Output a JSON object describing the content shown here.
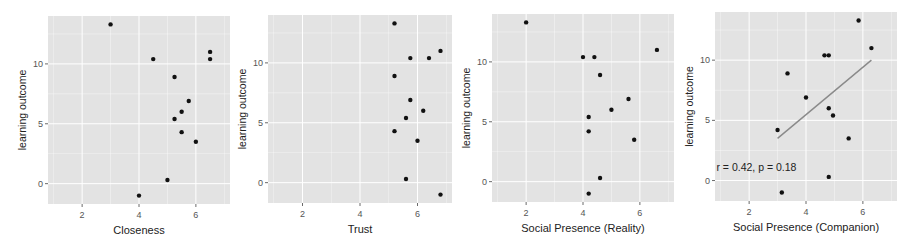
{
  "figure": {
    "background": "#ffffff",
    "panel_background": "#e3e3e3",
    "grid_color": "#ffffff",
    "point_color": "#111111",
    "line_color": "#8a8a8a",
    "axis_text_color": "#555555",
    "label_color": "#222222"
  },
  "chart_data": [
    {
      "type": "scatter",
      "title": "",
      "xlabel": "Closeness",
      "ylabel": "learning outcome",
      "xlim": [
        0.8,
        7.2
      ],
      "ylim": [
        -1.7,
        14.0
      ],
      "xticks": [
        2,
        4,
        6
      ],
      "yticks": [
        0,
        5,
        10
      ],
      "grid": true,
      "points": [
        {
          "x": 3.0,
          "y": 13.3
        },
        {
          "x": 4.5,
          "y": 10.4
        },
        {
          "x": 5.25,
          "y": 8.9
        },
        {
          "x": 5.75,
          "y": 6.9
        },
        {
          "x": 5.5,
          "y": 6.0
        },
        {
          "x": 5.25,
          "y": 5.4
        },
        {
          "x": 5.5,
          "y": 4.3
        },
        {
          "x": 6.0,
          "y": 3.5
        },
        {
          "x": 5.0,
          "y": 0.3
        },
        {
          "x": 4.0,
          "y": -1.0
        },
        {
          "x": 6.5,
          "y": 11.0
        },
        {
          "x": 6.5,
          "y": 10.4
        }
      ]
    },
    {
      "type": "scatter",
      "title": "",
      "xlabel": "Trust",
      "ylabel": "learning outcome",
      "xlim": [
        0.8,
        7.2
      ],
      "ylim": [
        -1.7,
        14.0
      ],
      "xticks": [
        2,
        4,
        6
      ],
      "yticks": [
        0,
        5,
        10
      ],
      "grid": true,
      "points": [
        {
          "x": 5.2,
          "y": 13.3
        },
        {
          "x": 5.75,
          "y": 10.4
        },
        {
          "x": 6.4,
          "y": 10.4
        },
        {
          "x": 6.8,
          "y": 11.0
        },
        {
          "x": 5.2,
          "y": 8.9
        },
        {
          "x": 5.75,
          "y": 6.9
        },
        {
          "x": 6.2,
          "y": 6.0
        },
        {
          "x": 5.6,
          "y": 5.4
        },
        {
          "x": 5.2,
          "y": 4.3
        },
        {
          "x": 6.0,
          "y": 3.5
        },
        {
          "x": 5.6,
          "y": 0.3
        },
        {
          "x": 6.8,
          "y": -1.0
        }
      ]
    },
    {
      "type": "scatter",
      "title": "",
      "xlabel": "Social Presence (Reality)",
      "ylabel": "learning outcome",
      "xlim": [
        0.8,
        7.2
      ],
      "ylim": [
        -1.7,
        14.0
      ],
      "xticks": [
        2,
        4,
        6
      ],
      "yticks": [
        0,
        5,
        10
      ],
      "grid": true,
      "points": [
        {
          "x": 2.0,
          "y": 13.3
        },
        {
          "x": 4.0,
          "y": 10.4
        },
        {
          "x": 4.4,
          "y": 10.4
        },
        {
          "x": 4.6,
          "y": 8.9
        },
        {
          "x": 5.6,
          "y": 6.9
        },
        {
          "x": 5.0,
          "y": 6.0
        },
        {
          "x": 4.2,
          "y": 5.4
        },
        {
          "x": 4.2,
          "y": 4.2
        },
        {
          "x": 5.8,
          "y": 3.5
        },
        {
          "x": 4.6,
          "y": 0.3
        },
        {
          "x": 4.2,
          "y": -1.0
        },
        {
          "x": 6.6,
          "y": 11.0
        }
      ]
    },
    {
      "type": "scatter",
      "title": "",
      "xlabel": "Social Presence (Companion)",
      "ylabel": "learning outcome",
      "xlim": [
        0.8,
        7.2
      ],
      "ylim": [
        -1.7,
        14.0
      ],
      "xticks": [
        2,
        4,
        6
      ],
      "yticks": [
        0,
        5,
        10
      ],
      "grid": true,
      "points": [
        {
          "x": 5.85,
          "y": 13.3
        },
        {
          "x": 6.3,
          "y": 11.0
        },
        {
          "x": 4.65,
          "y": 10.4
        },
        {
          "x": 4.8,
          "y": 10.4
        },
        {
          "x": 3.35,
          "y": 8.9
        },
        {
          "x": 4.0,
          "y": 6.9
        },
        {
          "x": 4.8,
          "y": 6.0
        },
        {
          "x": 4.95,
          "y": 5.4
        },
        {
          "x": 3.0,
          "y": 4.2
        },
        {
          "x": 5.5,
          "y": 3.5
        },
        {
          "x": 4.8,
          "y": 0.3
        },
        {
          "x": 3.15,
          "y": -1.0
        }
      ],
      "regression_line": {
        "x1": 3.0,
        "y1": 3.5,
        "x2": 6.3,
        "y2": 10.0
      },
      "annotation": {
        "text": "r = 0.42, p = 0.18",
        "x": 0.85,
        "y": 1.0
      }
    }
  ],
  "panels_layout": [
    {
      "left": 48,
      "top": 16,
      "right": 230,
      "bottom": 204
    },
    {
      "left": 268,
      "top": 15,
      "right": 452,
      "bottom": 203
    },
    {
      "left": 492,
      "top": 14,
      "right": 674,
      "bottom": 202
    },
    {
      "left": 715,
      "top": 12,
      "right": 897,
      "bottom": 201
    }
  ]
}
